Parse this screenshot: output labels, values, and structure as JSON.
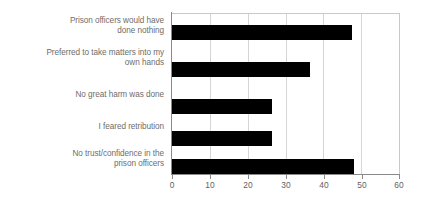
{
  "chart_data": {
    "type": "bar",
    "orientation": "horizontal",
    "title": "",
    "xlabel": "",
    "ylabel": "",
    "xlim": [
      0,
      60
    ],
    "xticks": [
      0,
      10,
      20,
      30,
      40,
      50,
      60
    ],
    "xtick_labels": [
      "0",
      "10",
      "20",
      "30",
      "40",
      "50",
      "60"
    ],
    "grid": true,
    "legend": null,
    "bar_color": "#000000",
    "categories": [
      "Prison officers would have\ndone nothing",
      "Preferred to take matters into my\nown hands",
      "No great harm was done",
      "I feared retribution",
      "No trust/confidence in the\nprison officers"
    ],
    "values": [
      47.5,
      36.5,
      26.5,
      26.5,
      48.0
    ]
  }
}
